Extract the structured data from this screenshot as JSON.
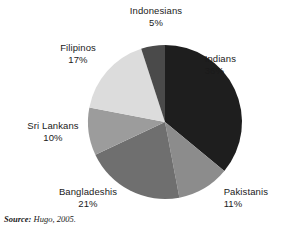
{
  "chart_data": {
    "type": "pie",
    "title": "",
    "subtitle": "",
    "xlabel": "",
    "ylabel": "",
    "legend_position": "none",
    "labels_position": "outside-radial",
    "grid": false,
    "start_angle_deg": 0,
    "direction": "clockwise",
    "categories": [
      "Indians",
      "Pakistanis",
      "Bangladeshis",
      "Sri Lankans",
      "Filipinos",
      "Indonesians"
    ],
    "values": [
      36,
      11,
      21,
      10,
      17,
      5
    ],
    "value_unit": "%",
    "slices": [
      {
        "label": "Indians",
        "value": 36,
        "display_value": "36%",
        "color": "#1e1e1e"
      },
      {
        "label": "Pakistanis",
        "value": 11,
        "display_value": "11%",
        "color": "#8c8c8c"
      },
      {
        "label": "Bangladeshis",
        "value": 21,
        "display_value": "21%",
        "color": "#6f6f6f"
      },
      {
        "label": "Sri Lankans",
        "value": 10,
        "display_value": "10%",
        "color": "#9c9c9c"
      },
      {
        "label": "Filipinos",
        "value": 17,
        "display_value": "17%",
        "color": "#dcdcdc"
      },
      {
        "label": "Indonesians",
        "value": 5,
        "display_value": "5%",
        "color": "#4a4a4a"
      }
    ]
  },
  "source": {
    "key": "Source:",
    "value": "Hugo, 2005."
  }
}
